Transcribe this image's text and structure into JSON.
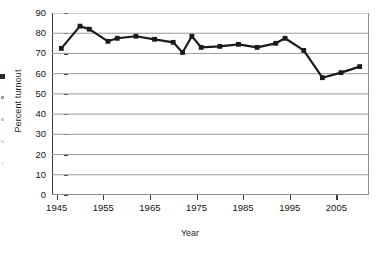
{
  "chart_data": {
    "type": "line",
    "title": "",
    "xlabel": "Year",
    "ylabel": "Percent turnout",
    "xlim": [
      1944,
      2012
    ],
    "ylim": [
      0,
      90
    ],
    "yticks": [
      0,
      10,
      20,
      30,
      40,
      50,
      60,
      70,
      80,
      90
    ],
    "xticks": [
      1945,
      1955,
      1965,
      1975,
      1985,
      1995,
      2005
    ],
    "grid": "horizontal",
    "legend": "none",
    "marker": "square",
    "line_color": "#1a1a1a",
    "grid_color": "#9a9a9a",
    "series": [
      {
        "name": "Percent turnout",
        "x": [
          1946,
          1950,
          1952,
          1956,
          1958,
          1962,
          1966,
          1970,
          1972,
          1974,
          1976,
          1980,
          1984,
          1988,
          1992,
          1994,
          1998,
          2002,
          2006,
          2010
        ],
        "values": [
          72.5,
          83.5,
          82.0,
          76.0,
          77.5,
          78.5,
          77.0,
          75.5,
          70.5,
          78.5,
          73.0,
          73.5,
          74.5,
          73.0,
          75.0,
          77.5,
          71.5,
          58.0,
          60.5,
          63.5
        ]
      }
    ]
  },
  "axis": {
    "y_tick_labels": [
      "90",
      "80",
      "70",
      "60",
      "50",
      "40",
      "30",
      "20",
      "10",
      "0"
    ],
    "x_tick_labels": [
      "1945",
      "1955",
      "1965",
      "1975",
      "1985",
      "1995",
      "2005"
    ],
    "x_title": "Year",
    "y_title": "Percent turnout"
  }
}
